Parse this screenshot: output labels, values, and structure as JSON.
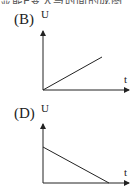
{
  "top_text": "显能E变大与时间的成图",
  "graphs": [
    {
      "id": "B",
      "label": "(B)",
      "y_axis_label": "U",
      "x_axis_label": "t",
      "description": "U increases linearly from origin"
    },
    {
      "id": "D",
      "label": "(D)",
      "y_axis_label": "U",
      "x_axis_label": "t",
      "description": "U decreases linearly from a positive intercept to zero"
    }
  ]
}
